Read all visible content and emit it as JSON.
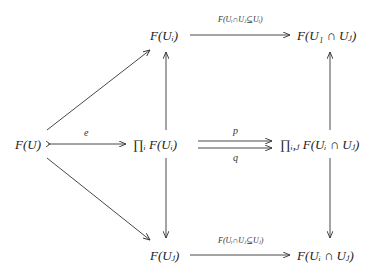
{
  "diagram": {
    "title": "",
    "nodes": {
      "FU": "F(U)",
      "prodFUi": "∏ᵢ F(Uᵢ)",
      "prodFUij": "∏ᵢ,ⱼ F(Uᵢ ∩ Uⱼ)",
      "FUi": "F(Uᵢ)",
      "FUj": "F(Uⱼ)",
      "FU1Uj": "F(U₁ ∩ Uⱼ)",
      "FUiUj": "F(Uᵢ ∩ Uⱼ)"
    },
    "arrows": [
      {
        "from": "FU",
        "to": "prodFUi",
        "label": "e",
        "style": "monomorphism"
      },
      {
        "from": "prodFUi",
        "to": "prodFUij",
        "label": "p",
        "style": "parallel-top"
      },
      {
        "from": "prodFUi",
        "to": "prodFUij",
        "label": "q",
        "style": "parallel-bottom"
      },
      {
        "from": "FU",
        "to": "FUi",
        "label": ""
      },
      {
        "from": "FU",
        "to": "FUj",
        "label": ""
      },
      {
        "from": "prodFUi",
        "to": "FUi",
        "label": ""
      },
      {
        "from": "prodFUi",
        "to": "FUj",
        "label": ""
      },
      {
        "from": "FUi",
        "to": "FU1Uj",
        "label": "F(Uᵢ∩Uⱼ⊆Uᵢ)"
      },
      {
        "from": "FUj",
        "to": "FUiUj",
        "label": "F(Uᵢ∩Uⱼ⊆Uⱼ)"
      },
      {
        "from": "prodFUij",
        "to": "FU1Uj",
        "label": ""
      },
      {
        "from": "prodFUij",
        "to": "FUiUj",
        "label": ""
      }
    ]
  }
}
